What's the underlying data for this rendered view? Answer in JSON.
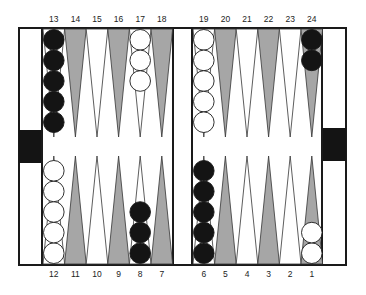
{
  "diagram": {
    "type": "backgammon-board",
    "colors": {
      "frame": "#1a1a1a",
      "dark_point": "#a6a6a6",
      "light_point": "#ffffff",
      "black_checker": "#141414",
      "white_checker": "#ffffff",
      "tray_block": "#141414"
    },
    "top_labels": [
      "13",
      "14",
      "15",
      "16",
      "17",
      "18",
      "19",
      "20",
      "21",
      "22",
      "23",
      "24"
    ],
    "bottom_labels": [
      "12",
      "11",
      "10",
      "9",
      "8",
      "7",
      "6",
      "5",
      "4",
      "3",
      "2",
      "1"
    ],
    "points": [
      {
        "point": 13,
        "checker": "black",
        "count": 5
      },
      {
        "point": 14,
        "checker": null,
        "count": 0
      },
      {
        "point": 15,
        "checker": null,
        "count": 0
      },
      {
        "point": 16,
        "checker": null,
        "count": 0
      },
      {
        "point": 17,
        "checker": "white",
        "count": 3
      },
      {
        "point": 18,
        "checker": null,
        "count": 0
      },
      {
        "point": 19,
        "checker": "white",
        "count": 5
      },
      {
        "point": 20,
        "checker": null,
        "count": 0
      },
      {
        "point": 21,
        "checker": null,
        "count": 0
      },
      {
        "point": 22,
        "checker": null,
        "count": 0
      },
      {
        "point": 23,
        "checker": null,
        "count": 0
      },
      {
        "point": 24,
        "checker": "black",
        "count": 2
      },
      {
        "point": 12,
        "checker": "white",
        "count": 5
      },
      {
        "point": 11,
        "checker": null,
        "count": 0
      },
      {
        "point": 10,
        "checker": null,
        "count": 0
      },
      {
        "point": 9,
        "checker": null,
        "count": 0
      },
      {
        "point": 8,
        "checker": "black",
        "count": 3
      },
      {
        "point": 7,
        "checker": null,
        "count": 0
      },
      {
        "point": 6,
        "checker": "black",
        "count": 5
      },
      {
        "point": 5,
        "checker": null,
        "count": 0
      },
      {
        "point": 4,
        "checker": null,
        "count": 0
      },
      {
        "point": 3,
        "checker": null,
        "count": 0
      },
      {
        "point": 2,
        "checker": null,
        "count": 0
      },
      {
        "point": 1,
        "checker": "white",
        "count": 2
      }
    ]
  }
}
